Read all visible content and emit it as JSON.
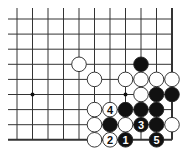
{
  "diagram": {
    "type": "go-board-partial",
    "region": "lower-right corner",
    "columns": 11,
    "rows": 9,
    "grid": {
      "x0": 17,
      "dx": 15.5,
      "y0": 19,
      "dy": 15.1,
      "right_edge": true,
      "bottom_edge": true,
      "line_color": "#333333"
    },
    "star_points": [
      {
        "col": 1,
        "row": 5
      },
      {
        "col": 7,
        "row": 5
      }
    ],
    "stones": [
      {
        "col": 4,
        "row": 3,
        "color": "white"
      },
      {
        "col": 8,
        "row": 3,
        "color": "black"
      },
      {
        "col": 5,
        "row": 4,
        "color": "white"
      },
      {
        "col": 7,
        "row": 4,
        "color": "white"
      },
      {
        "col": 8,
        "row": 4,
        "color": "white"
      },
      {
        "col": 9,
        "row": 4,
        "color": "white"
      },
      {
        "col": 10,
        "row": 4,
        "color": "white"
      },
      {
        "col": 8,
        "row": 5,
        "color": "white"
      },
      {
        "col": 9,
        "row": 5,
        "color": "black"
      },
      {
        "col": 10,
        "row": 5,
        "color": "black"
      },
      {
        "col": 5,
        "row": 6,
        "color": "white"
      },
      {
        "col": 6,
        "row": 6,
        "color": "white",
        "label": "4"
      },
      {
        "col": 7,
        "row": 6,
        "color": "black"
      },
      {
        "col": 8,
        "row": 6,
        "color": "black"
      },
      {
        "col": 9,
        "row": 6,
        "color": "black"
      },
      {
        "col": 5,
        "row": 7,
        "color": "white"
      },
      {
        "col": 6,
        "row": 7,
        "color": "black"
      },
      {
        "col": 7,
        "row": 7,
        "color": "white"
      },
      {
        "col": 8,
        "row": 7,
        "color": "black",
        "label": "3"
      },
      {
        "col": 9,
        "row": 7,
        "color": "black"
      },
      {
        "col": 10,
        "row": 7,
        "color": "white"
      },
      {
        "col": 5,
        "row": 8,
        "color": "white"
      },
      {
        "col": 6,
        "row": 8,
        "color": "white",
        "label": "2"
      },
      {
        "col": 7,
        "row": 8,
        "color": "black",
        "label": "1"
      },
      {
        "col": 9,
        "row": 8,
        "color": "black",
        "label": "5"
      }
    ],
    "move_sequence": [
      {
        "move": "1",
        "color": "black",
        "col": 7,
        "row": 8
      },
      {
        "move": "2",
        "color": "white",
        "col": 6,
        "row": 8
      },
      {
        "move": "3",
        "color": "black",
        "col": 8,
        "row": 7
      },
      {
        "move": "4",
        "color": "white",
        "col": 6,
        "row": 6
      },
      {
        "move": "5",
        "color": "black",
        "col": 9,
        "row": 8
      }
    ],
    "colors": {
      "black_stone": "#111111",
      "white_stone": "#ffffff",
      "stone_outline": "#222222",
      "label_on_black": "#ffffff",
      "label_on_white": "#111111"
    }
  }
}
